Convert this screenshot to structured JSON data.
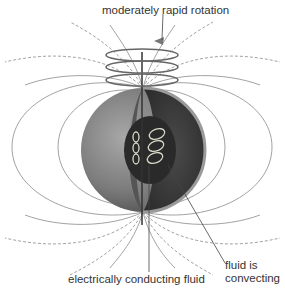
{
  "diagram": {
    "type": "planetary-dynamo",
    "labels": {
      "rotation": "moderately rapid rotation",
      "conducting_fluid": "electrically conducting fluid",
      "convecting_line1": "fluid is",
      "convecting_line2": "convecting"
    },
    "colors": {
      "field_line": "#8a8a8a",
      "planet_surface": "#7a7a7a",
      "interior": "#3d3d3d",
      "core": "#2a2a2a",
      "convection_cells": "#d8d8c8",
      "background": "#ffffff"
    }
  }
}
